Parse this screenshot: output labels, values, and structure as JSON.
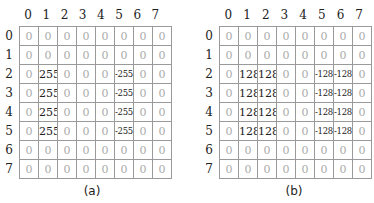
{
  "panels": [
    {
      "id": "a",
      "caption": "(a)",
      "col_labels": [
        "0",
        "1",
        "2",
        "3",
        "4",
        "5",
        "6",
        "7"
      ],
      "row_labels": [
        "0",
        "1",
        "2",
        "3",
        "4",
        "5",
        "6",
        "7"
      ],
      "matrix": [
        [
          0,
          0,
          0,
          0,
          0,
          0,
          0,
          0
        ],
        [
          0,
          0,
          0,
          0,
          0,
          0,
          0,
          0
        ],
        [
          0,
          255,
          0,
          0,
          0,
          -255,
          0,
          0
        ],
        [
          0,
          255,
          0,
          0,
          0,
          -255,
          0,
          0
        ],
        [
          0,
          255,
          0,
          0,
          0,
          -255,
          0,
          0
        ],
        [
          0,
          255,
          0,
          0,
          0,
          -255,
          0,
          0
        ],
        [
          0,
          0,
          0,
          0,
          0,
          0,
          0,
          0
        ],
        [
          0,
          0,
          0,
          0,
          0,
          0,
          0,
          0
        ]
      ]
    },
    {
      "id": "b",
      "caption": "(b)",
      "col_labels": [
        "0",
        "1",
        "2",
        "3",
        "4",
        "5",
        "6",
        "7"
      ],
      "row_labels": [
        "0",
        "1",
        "2",
        "3",
        "4",
        "5",
        "6",
        "7"
      ],
      "matrix": [
        [
          0,
          0,
          0,
          0,
          0,
          0,
          0,
          0
        ],
        [
          0,
          0,
          0,
          0,
          0,
          0,
          0,
          0
        ],
        [
          0,
          128,
          128,
          0,
          0,
          -128,
          -128,
          0
        ],
        [
          0,
          128,
          128,
          0,
          0,
          -128,
          -128,
          0
        ],
        [
          0,
          128,
          128,
          0,
          0,
          -128,
          -128,
          0
        ],
        [
          0,
          128,
          128,
          0,
          0,
          -128,
          -128,
          0
        ],
        [
          0,
          0,
          0,
          0,
          0,
          0,
          0,
          0
        ],
        [
          0,
          0,
          0,
          0,
          0,
          0,
          0,
          0
        ]
      ]
    }
  ],
  "colors": {
    "zero_text": "#aaaaaa",
    "nonzero_text": "#222222",
    "grid_line": "#9a9a9a"
  }
}
